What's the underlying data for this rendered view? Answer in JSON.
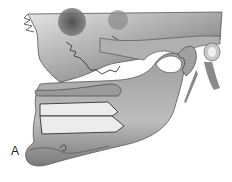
{
  "figure": {
    "panel_label": "A",
    "colors": {
      "background": "#ffffff",
      "bone_light": "#d8d8d8",
      "bone_mid": "#9a9a9a",
      "bone_dark": "#555555",
      "block_fill": "#ececec",
      "outline": "#444444"
    }
  }
}
